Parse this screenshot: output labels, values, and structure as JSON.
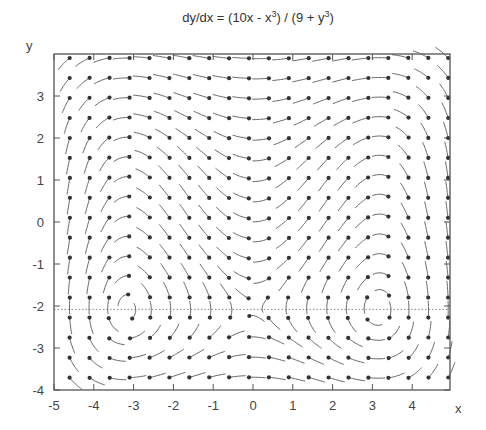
{
  "chart_data": {
    "type": "direction-field",
    "title_parts": {
      "main": "dy/dx = (10x - x",
      "sup1": "3",
      "mid": ") / (9 + y",
      "sup2": "3",
      "end": ")"
    },
    "equation": {
      "dy_numerator": "10x - x^3",
      "dx_denominator": "9 + y^3"
    },
    "xlabel": "x",
    "ylabel": "y",
    "xlim": [
      -5,
      5
    ],
    "ylim": [
      -4,
      4
    ],
    "xticks": [
      -5,
      -4,
      -3,
      -2,
      -1,
      0,
      1,
      2,
      3,
      4
    ],
    "yticks": [
      -4,
      -3,
      -2,
      -1,
      0,
      1,
      2,
      3
    ],
    "reference_line": {
      "y": -2.08,
      "style": "dotted",
      "note": "y = -9^(1/3), where dx/dt = 0"
    },
    "grid": {
      "x_start": -4.6,
      "x_step": 0.5,
      "x_count": 20,
      "y_start": -3.7,
      "y_step": 0.475,
      "y_count": 17
    },
    "glyph": {
      "segment_length": 0.42,
      "style": "curved segment ending in dot"
    },
    "colors": {
      "axis": "#555555",
      "glyph": "#555555",
      "dot": "#333333",
      "dotted": "#888888"
    }
  }
}
